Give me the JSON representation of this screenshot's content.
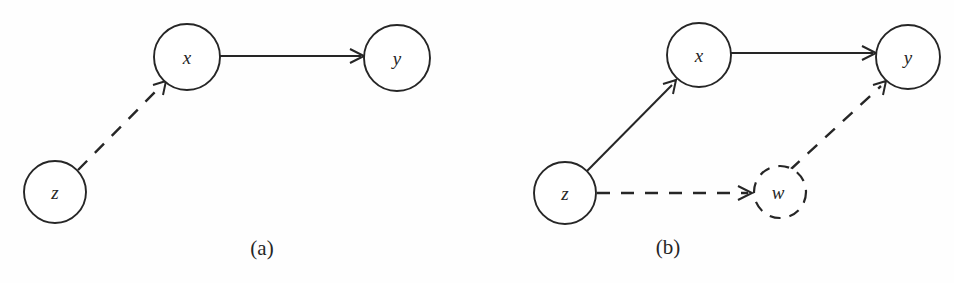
{
  "figure": {
    "background_color": "#fefefe",
    "ink_color": "#262626",
    "panels": [
      {
        "id": "panel-a",
        "caption": "(a)",
        "caption_x": 262,
        "caption_y": 255,
        "nodes": [
          {
            "id": "x",
            "label": "x",
            "cx": 187,
            "cy": 57,
            "r": 33,
            "style": "solid"
          },
          {
            "id": "y",
            "label": "y",
            "cx": 397,
            "cy": 58,
            "r": 33,
            "style": "solid"
          },
          {
            "id": "z",
            "label": "z",
            "cx": 55,
            "cy": 192,
            "r": 31,
            "style": "solid"
          }
        ],
        "edges": [
          {
            "id": "x-to-y",
            "from": "x",
            "to": "y",
            "style": "solid",
            "arrow": true,
            "x1": 220,
            "y1": 56,
            "x2": 363,
            "y2": 56
          },
          {
            "id": "z-to-x",
            "from": "z",
            "to": "x",
            "style": "dashed",
            "arrow": true,
            "x1": 78,
            "y1": 170,
            "x2": 164,
            "y2": 83
          }
        ]
      },
      {
        "id": "panel-b",
        "caption": "(b)",
        "caption_x": 668,
        "caption_y": 254,
        "nodes": [
          {
            "id": "x",
            "label": "x",
            "cx": 699,
            "cy": 55,
            "r": 32,
            "style": "solid"
          },
          {
            "id": "y",
            "label": "y",
            "cx": 908,
            "cy": 57,
            "r": 32,
            "style": "solid"
          },
          {
            "id": "z",
            "label": "z",
            "cx": 565,
            "cy": 193,
            "r": 31,
            "style": "solid"
          },
          {
            "id": "w",
            "label": "w",
            "cx": 780,
            "cy": 192,
            "r": 26,
            "style": "dashed"
          }
        ],
        "edges": [
          {
            "id": "x-to-y",
            "from": "x",
            "to": "y",
            "style": "solid",
            "arrow": true,
            "x1": 731,
            "y1": 53,
            "x2": 875,
            "y2": 53
          },
          {
            "id": "z-to-x",
            "from": "z",
            "to": "x",
            "style": "solid",
            "arrow": true,
            "x1": 587,
            "y1": 171,
            "x2": 674,
            "y2": 82
          },
          {
            "id": "z-to-w",
            "from": "z",
            "to": "w",
            "style": "dashed",
            "arrow": true,
            "x1": 597,
            "y1": 193,
            "x2": 751,
            "y2": 193
          },
          {
            "id": "w-to-y",
            "from": "w",
            "to": "y",
            "style": "dashed",
            "arrow": true,
            "x1": 793,
            "y1": 167,
            "x2": 884,
            "y2": 83
          }
        ]
      }
    ]
  }
}
